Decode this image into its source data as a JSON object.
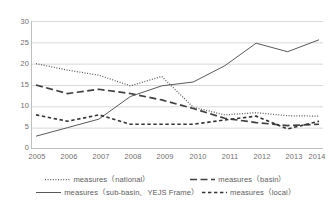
{
  "chart_data": {
    "type": "line",
    "title": "",
    "subtitle": "",
    "xlabel": "",
    "ylabel": "",
    "categories": [
      "2005",
      "2006",
      "2007",
      "2008",
      "2009",
      "2010",
      "2011",
      "2012",
      "2013",
      "2014"
    ],
    "xlim": [
      2005,
      2014
    ],
    "ylim": [
      0,
      30
    ],
    "yticks": [
      "0",
      "5",
      "10",
      "15",
      "20",
      "25",
      "30"
    ],
    "grid": "horizontal",
    "legend_position": "bottom",
    "series": [
      {
        "name": "measures（national）",
        "style": "dotted",
        "color": "#595959",
        "values": [
          20,
          18.5,
          17.3,
          14.8,
          17,
          9.8,
          8,
          8.5,
          7.8,
          7.7
        ]
      },
      {
        "name": "measures（basin）",
        "style": "long-dash",
        "color": "#404040",
        "values": [
          15,
          13,
          14,
          13,
          11.5,
          9.5,
          7.2,
          6.2,
          5.5,
          5.8
        ]
      },
      {
        "name": "measures（sub-basin、YEJS Frame）",
        "style": "solid",
        "color": "#595959",
        "values": [
          3,
          5,
          7,
          12.3,
          14.8,
          15.7,
          19.5,
          24.8,
          22.8,
          25.6
        ]
      },
      {
        "name": "measures（local）",
        "style": "short-dash",
        "color": "#333333",
        "values": [
          8,
          6.5,
          8,
          5.8,
          5.8,
          5.8,
          6.8,
          7.7,
          4.7,
          6.5
        ]
      }
    ]
  },
  "axes": {
    "y_ticks": [
      "30",
      "25",
      "20",
      "15",
      "10",
      "5",
      "0"
    ],
    "x_ticks": [
      "2005",
      "2006",
      "2007",
      "2008",
      "2009",
      "2010",
      "2011",
      "2012",
      "2013",
      "2014"
    ]
  },
  "legend": {
    "items": [
      {
        "label": "measures（national）",
        "style": "dotted"
      },
      {
        "label": "measures（basin）",
        "style": "long-dash"
      },
      {
        "label": "measures（sub-basin、YEJS Frame）",
        "style": "solid"
      },
      {
        "label": "measures（local）",
        "style": "short-dash"
      }
    ]
  },
  "colors": {
    "line": "#595959",
    "grid": "#d9d9d9",
    "axis": "#bfbfbf",
    "text": "#6e6e6e",
    "background": "#ffffff"
  }
}
